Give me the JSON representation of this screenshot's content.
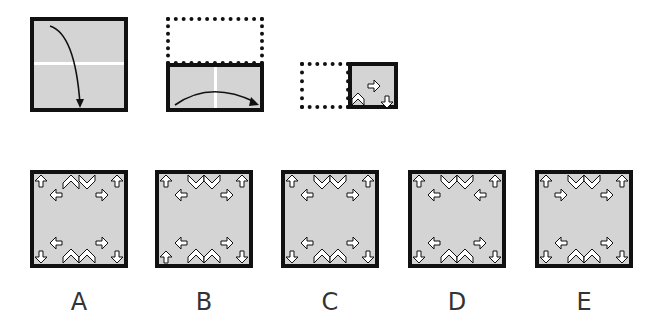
{
  "puzzle": {
    "type": "paper-folding",
    "steps": [
      {
        "id": 1,
        "description": "Square paper folded top half down along horizontal center line",
        "fold_line": "horizontal",
        "arrow": "down"
      },
      {
        "id": 2,
        "description": "Folded rectangle folded left half onto right along vertical center line",
        "fold_line": "vertical",
        "arrow": "right"
      },
      {
        "id": 3,
        "description": "Small square with symbols drawn",
        "symbols": [
          {
            "shape": "chevron-up",
            "position": "bottom-left"
          },
          {
            "shape": "arrow-right",
            "position": "center-right"
          },
          {
            "shape": "arrow-down",
            "position": "bottom-right"
          }
        ]
      }
    ],
    "options": [
      {
        "label": "A",
        "top": [
          "arrow-up",
          "chevron-up",
          "chevron-down",
          "arrow-up"
        ],
        "mid_top": [
          "arrow-left",
          "arrow-right"
        ],
        "mid_bottom": [
          "arrow-left",
          "arrow-right"
        ],
        "bottom": [
          "arrow-down",
          "chevron-up",
          "chevron-up",
          "arrow-down"
        ]
      },
      {
        "label": "B",
        "top": [
          "arrow-up",
          "chevron-down",
          "chevron-down",
          "arrow-up"
        ],
        "mid_top": [
          "arrow-left",
          "arrow-right"
        ],
        "mid_bottom": [
          "arrow-left",
          "arrow-right"
        ],
        "bottom": [
          "arrow-up",
          "chevron-up",
          "chevron-up",
          "arrow-down"
        ]
      },
      {
        "label": "C",
        "top": [
          "arrow-up",
          "chevron-down",
          "chevron-down",
          "arrow-up"
        ],
        "mid_top": [
          "arrow-left",
          "arrow-right"
        ],
        "mid_bottom": [
          "arrow-left",
          "arrow-right"
        ],
        "bottom": [
          "arrow-down",
          "chevron-up",
          "chevron-up",
          "arrow-down"
        ]
      },
      {
        "label": "D",
        "top": [
          "arrow-up",
          "chevron-down",
          "chevron-down",
          "arrow-up"
        ],
        "mid_top": [
          "arrow-left",
          "arrow-left"
        ],
        "mid_bottom": [
          "arrow-left",
          "arrow-right"
        ],
        "bottom": [
          "arrow-down",
          "chevron-up",
          "chevron-up",
          "arrow-down"
        ]
      },
      {
        "label": "E",
        "top": [
          "arrow-up",
          "chevron-down",
          "chevron-down",
          "arrow-up"
        ],
        "mid_top": [
          "arrow-right",
          "arrow-right"
        ],
        "mid_bottom": [
          "arrow-left",
          "arrow-right"
        ],
        "bottom": [
          "arrow-down",
          "chevron-up",
          "chevron-up",
          "arrow-down"
        ]
      }
    ]
  },
  "colors": {
    "paper": "#d4d4d4",
    "border": "#111111",
    "fold_line": "#ffffff"
  }
}
